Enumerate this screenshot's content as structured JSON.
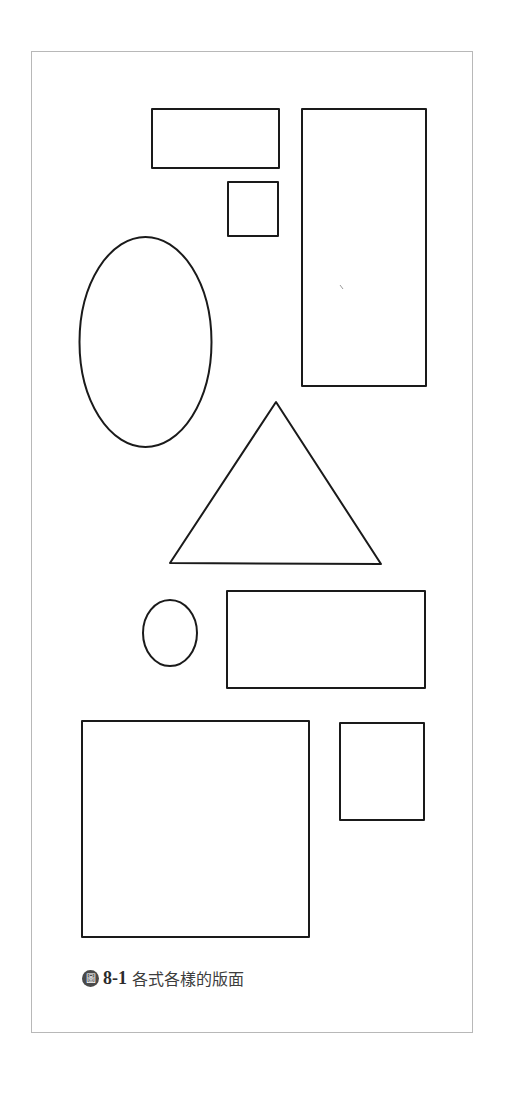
{
  "figure": {
    "caption": {
      "badge_label": "圖",
      "number": "8-1",
      "title": "各式各樣的版面"
    },
    "colors": {
      "frame_border": "#b8b8b8",
      "shape_stroke": "#1a1a1a",
      "badge_fill": "#4a4a4a",
      "background": "#ffffff"
    },
    "shapes": [
      {
        "id": "rect-top-left",
        "type": "rect",
        "x": 152,
        "y": 109,
        "w": 127,
        "h": 59
      },
      {
        "id": "square-small-top",
        "type": "rect",
        "x": 228,
        "y": 182,
        "w": 50,
        "h": 54
      },
      {
        "id": "rect-tall-right",
        "type": "rect",
        "x": 302,
        "y": 109,
        "w": 124,
        "h": 277
      },
      {
        "id": "ellipse-large",
        "type": "ellipse",
        "cx": 145.5,
        "cy": 342,
        "rx": 66,
        "ry": 105
      },
      {
        "id": "triangle",
        "type": "triangle",
        "points": [
          [
            276,
            402
          ],
          [
            170,
            563
          ],
          [
            381,
            564
          ]
        ]
      },
      {
        "id": "ellipse-small",
        "type": "ellipse",
        "cx": 170,
        "cy": 633,
        "rx": 27,
        "ry": 33
      },
      {
        "id": "rect-wide-middle",
        "type": "rect",
        "x": 227,
        "y": 591,
        "w": 198,
        "h": 97
      },
      {
        "id": "square-large-bottom",
        "type": "rect",
        "x": 82,
        "y": 721,
        "w": 227,
        "h": 216
      },
      {
        "id": "rect-small-bottom-right",
        "type": "rect",
        "x": 340,
        "y": 723,
        "w": 84,
        "h": 97
      }
    ]
  }
}
